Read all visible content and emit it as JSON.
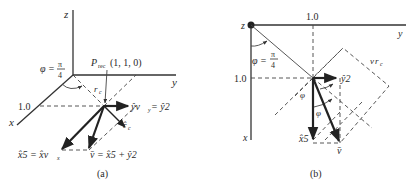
{
  "figure": {
    "panels": [
      {
        "id": "a",
        "caption": "(a)",
        "axes": {
          "x": "x",
          "y": "y",
          "z": "z"
        },
        "angle_label": {
          "phi": "φ =",
          "num": "π",
          "den": "4"
        },
        "tick_label": "1.0",
        "point_label": {
          "P": "P",
          "sub": "rec",
          "coords": "(1, 1, 0)"
        },
        "vectors": {
          "rc_label": "r",
          "rc_sub": "c",
          "rc_hat_label": "r̂",
          "rc_hat_sub": "c",
          "y_label": "ŷv",
          "y_sub": "y",
          "y_eq": " = ŷ2",
          "x_label_left": "x̂5 = x̂v",
          "x_sub": "x",
          "v_label": "v̄ = x̂5 + ŷ2"
        }
      },
      {
        "id": "b",
        "caption": "(b)",
        "axes": {
          "x": "x",
          "y": "y",
          "z": "z"
        },
        "angle_label": {
          "phi": "φ =",
          "num": "π",
          "den": "4"
        },
        "tick_top": "1.0",
        "tick_left": "1.0",
        "vectors": {
          "y_label": "ŷ2",
          "x_label": "x̂5",
          "v_label": "v̄",
          "vrc_label": "v",
          "vrc_sub": "r",
          "vrc_subsub": "c",
          "phi1": "φ",
          "phi2": "φ"
        }
      }
    ]
  }
}
